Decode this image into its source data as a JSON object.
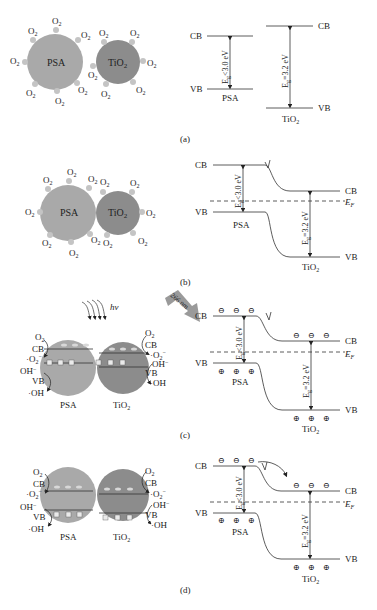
{
  "colors": {
    "psa_fill": "#a9a9a9",
    "tio2_fill": "#8c8c8c",
    "o2_dot": "#c4c4c4",
    "line": "#333333",
    "arrow_fill": "#9a9a9a"
  },
  "labels": {
    "psa": "PSA",
    "tio2": "TiO",
    "tio2_sub": "2",
    "o2": "O",
    "o2_sub": "2",
    "cb": "CB",
    "vb": "VB",
    "ef": "E",
    "ef_sub": "F",
    "eg_psa": "<3.0 eV",
    "eg_tio2": "=3.2 eV",
    "eg_sym": "E",
    "eg_sub": "g",
    "hv": "hv",
    "laser": "266 nm",
    "superoxide": "·O",
    "superoxide_sup": "−",
    "hydroxide": "OH",
    "hydroxide_sup": "−",
    "hydroxyl_radical": "·OH",
    "electron": "⊖",
    "hole": "⊕"
  },
  "panels": [
    {
      "id": "a",
      "caption": "(a)"
    },
    {
      "id": "b",
      "caption": "(b)"
    },
    {
      "id": "c",
      "caption": "(c)"
    },
    {
      "id": "d",
      "caption": "(d)"
    }
  ]
}
